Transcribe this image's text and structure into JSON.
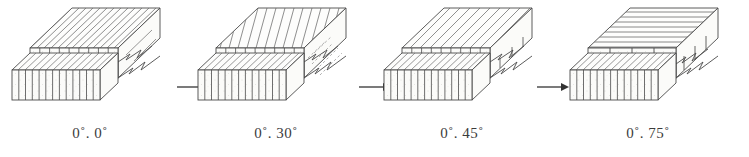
{
  "figure": {
    "type": "technical-diagram",
    "title_visible": false,
    "background_color": "#ffffff",
    "line_color": "#4a4a4a",
    "face_fill": "#fbfbf9",
    "caption_color": "#3b3b3b",
    "arrow_color": "#333333",
    "panel_count": 4,
    "arrow_count": 3,
    "arrow_glyph": "right-arrow"
  },
  "panels": [
    {
      "id": "panel-1",
      "caption": "0˚. 0˚",
      "angle_primary_deg": 0,
      "angle_secondary_deg": 0,
      "top_face_stripe_angle_deg": 0,
      "top_face_stripe_count": 12,
      "front_segment_count": 9,
      "base_segment_count": 13,
      "left_x": 0
    },
    {
      "id": "panel-2",
      "caption": "0˚. 30˚",
      "angle_primary_deg": 0,
      "angle_secondary_deg": 30,
      "top_face_stripe_angle_deg": 30,
      "top_face_stripe_count": 11,
      "front_segment_count": 9,
      "base_segment_count": 13,
      "left_x": 186
    },
    {
      "id": "panel-3",
      "caption": "0˚. 45˚",
      "angle_primary_deg": 0,
      "angle_secondary_deg": 45,
      "top_face_stripe_angle_deg": 45,
      "top_face_stripe_count": 13,
      "front_segment_count": 9,
      "base_segment_count": 13,
      "left_x": 372
    },
    {
      "id": "panel-4",
      "caption": "0˚. 75˚",
      "angle_primary_deg": 0,
      "angle_secondary_deg": 75,
      "top_face_stripe_angle_deg": 75,
      "top_face_stripe_count": 8,
      "front_segment_count": 4,
      "base_segment_count": 13,
      "left_x": 558
    }
  ],
  "arrows": [
    {
      "id": "arrow-1",
      "left_x": 176,
      "label": "→"
    },
    {
      "id": "arrow-2",
      "left_x": 358,
      "label": "→"
    },
    {
      "id": "arrow-3",
      "left_x": 536,
      "label": "→"
    }
  ]
}
